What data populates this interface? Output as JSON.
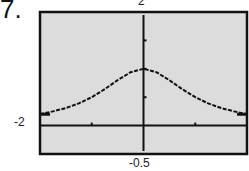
{
  "problem_number": "7.",
  "chart_data": {
    "type": "line",
    "title": "",
    "xlabel": "",
    "ylabel": "",
    "xlim": [
      -2,
      2
    ],
    "ylim": [
      -0.5,
      2
    ],
    "window_labels": {
      "ymax": "2",
      "xmin": "-2",
      "ymin": "-0.5"
    },
    "x_ticks": [
      -1,
      0,
      1
    ],
    "y_ticks": [
      0.5,
      1,
      1.5,
      2
    ],
    "grid": false,
    "series": [
      {
        "name": "curve",
        "x": [
          -2,
          -1.75,
          -1.5,
          -1.25,
          -1,
          -0.75,
          -0.5,
          -0.25,
          0,
          0.25,
          0.5,
          0.75,
          1,
          1.25,
          1.5,
          1.75,
          2
        ],
        "values": [
          0.2,
          0.25,
          0.31,
          0.39,
          0.5,
          0.64,
          0.8,
          0.94,
          1.0,
          0.94,
          0.8,
          0.64,
          0.5,
          0.39,
          0.31,
          0.25,
          0.2
        ]
      }
    ],
    "colors": {
      "background": "#dcdcdc",
      "frame": "#111111",
      "curve": "#111111"
    }
  }
}
